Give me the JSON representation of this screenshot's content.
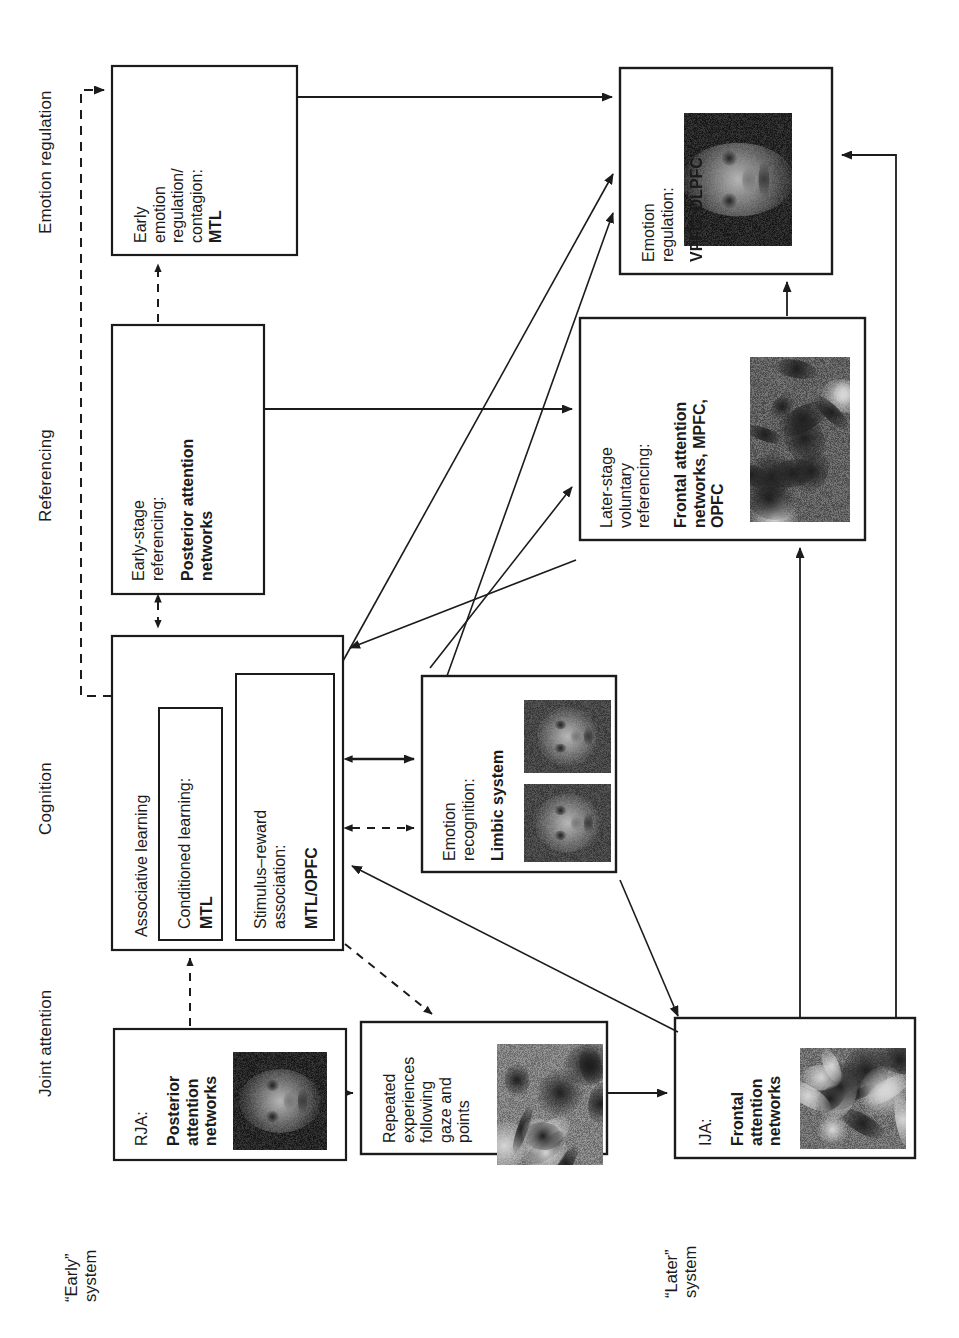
{
  "figure": {
    "orientation": "rotated-90-ccw"
  },
  "column_headers": [
    {
      "id": "emotion-regulation",
      "label": "Emotion regulation"
    },
    {
      "id": "referencing",
      "label": "Referencing"
    },
    {
      "id": "cognition",
      "label": "Cognition"
    },
    {
      "id": "joint-attention",
      "label": "Joint attention"
    }
  ],
  "system_labels": [
    {
      "id": "early-system",
      "label": "“Early”\nsystem"
    },
    {
      "id": "later-system",
      "label": "“Later”\nsystem"
    }
  ],
  "boxes": {
    "early_emotion": {
      "plain": "Early\nemotion\nregulation/\ncontagion:",
      "bold": "MTL"
    },
    "emotion_regulation": {
      "plain": "Emotion\nregulation:",
      "bold": "VPFC, DLPFC"
    },
    "early_referencing": {
      "plain": "Early-stage\nreferencing:",
      "bold": "Posterior attention\nnetworks"
    },
    "later_referencing": {
      "plain": "Later-stage\nvoluntary\nreferencing:",
      "bold": "Frontal attention\nnetworks, MPFC,\nOPFC"
    },
    "associative_learning": {
      "plain": "Associative learning"
    },
    "conditioned_learning": {
      "plain": "Conditioned learning:",
      "bold": "MTL"
    },
    "stimulus_reward": {
      "plain": "Stimulus–reward\nassociation:",
      "bold": "MTL/OPFC"
    },
    "emotion_recognition": {
      "plain": "Emotion\nrecognition:",
      "bold": "Limbic system"
    },
    "rja": {
      "plain": "RJA:",
      "bold": "Posterior\nattention\nnetworks"
    },
    "repeated_experiences": {
      "plain": "Repeated\nexperiences\nfollowing\ngaze and\npoints"
    },
    "ija": {
      "plain": "IJA:",
      "bold": "Frontal\nattention\nnetworks"
    }
  },
  "colors": {
    "stroke": "#1b1b1b",
    "text": "#1b1b1b",
    "background": "#ffffff"
  }
}
